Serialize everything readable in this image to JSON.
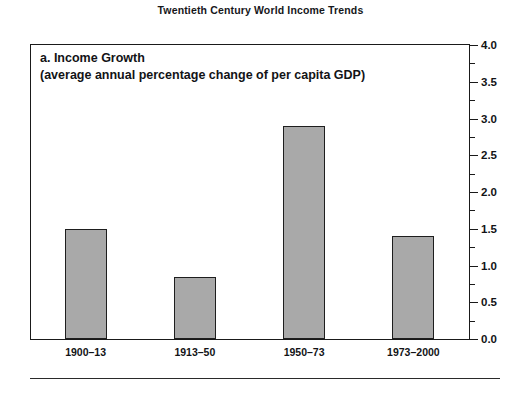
{
  "figure": {
    "title": "Twentieth Century World Income Trends",
    "panel_label": "a. Income Growth",
    "panel_sublabel": "(average annual percentage change of per capita GDP)",
    "bottom_rule": true
  },
  "colors": {
    "bar_fill": "#a9a9a9",
    "bar_border": "#1e1e1e",
    "frame": "#1a1a1a",
    "text": "#121316",
    "background": "#ffffff"
  },
  "chart_data": {
    "type": "bar",
    "title": "Twentieth Century World Income Trends",
    "subtitle": "a. Income Growth (average annual percentage change of per capita GDP)",
    "xlabel": "",
    "ylabel": "",
    "categories": [
      "1900–13",
      "1913–50",
      "1950–73",
      "1973–2000"
    ],
    "values": [
      1.5,
      0.85,
      2.9,
      1.4
    ],
    "ylim": [
      0.0,
      4.0
    ],
    "ytick_labels": [
      "0.0",
      "0.5",
      "1.0",
      "1.5",
      "2.0",
      "2.5",
      "3.0",
      "3.5",
      "4.0"
    ],
    "ytick_values": [
      0.0,
      0.5,
      1.0,
      1.5,
      2.0,
      2.5,
      3.0,
      3.5,
      4.0
    ],
    "yminor_tick_values": [
      0.25,
      0.75,
      1.25,
      1.75,
      2.25,
      2.75,
      3.25,
      3.75
    ],
    "y_axis_position": "right",
    "grid": false,
    "legend": null
  }
}
